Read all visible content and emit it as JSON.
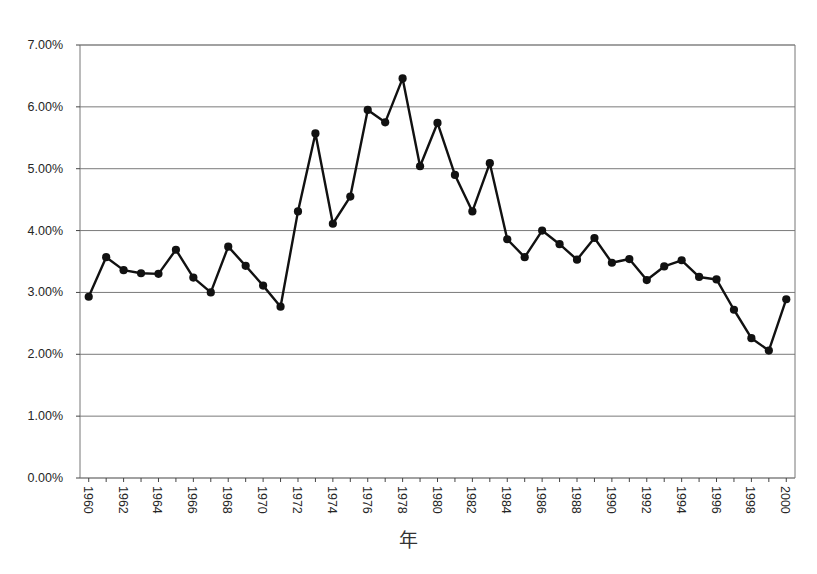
{
  "chart_data": {
    "type": "line",
    "title": "",
    "xlabel": "年",
    "ylabel": "",
    "x": [
      1960,
      1961,
      1962,
      1963,
      1964,
      1965,
      1966,
      1967,
      1968,
      1969,
      1970,
      1971,
      1972,
      1973,
      1974,
      1975,
      1976,
      1977,
      1978,
      1979,
      1980,
      1981,
      1982,
      1983,
      1984,
      1985,
      1986,
      1987,
      1988,
      1989,
      1990,
      1991,
      1992,
      1993,
      1994,
      1995,
      1996,
      1997,
      1998,
      1999,
      2000
    ],
    "values": [
      2.93,
      3.57,
      3.36,
      3.31,
      3.3,
      3.69,
      3.24,
      3.0,
      3.74,
      3.43,
      3.11,
      2.77,
      4.31,
      5.57,
      4.11,
      4.55,
      5.95,
      5.75,
      6.46,
      5.04,
      5.74,
      4.9,
      4.31,
      5.09,
      3.86,
      3.57,
      4.0,
      3.78,
      3.53,
      3.88,
      3.48,
      3.54,
      3.2,
      3.42,
      3.52,
      3.25,
      3.21,
      2.72,
      2.26,
      2.06,
      2.89
    ],
    "xlim": [
      1959.5,
      2000.5
    ],
    "ylim": [
      0.0,
      7.0
    ],
    "ytick_labels": [
      "7.00%",
      "6.00%",
      "5.00%",
      "4.00%",
      "3.00%",
      "2.00%",
      "1.00%",
      "0.00%"
    ],
    "ytick_values": [
      7.0,
      6.0,
      5.0,
      4.0,
      3.0,
      2.0,
      1.0,
      0.0
    ],
    "xtick_labels": [
      "1960",
      "1962",
      "1964",
      "1966",
      "1968",
      "1970",
      "1972",
      "1974",
      "1976",
      "1978",
      "1980",
      "1982",
      "1984",
      "1986",
      "1988",
      "1990",
      "1992",
      "1994",
      "1996",
      "1998",
      "2000"
    ],
    "xtick_values": [
      1960,
      1962,
      1964,
      1966,
      1968,
      1970,
      1972,
      1974,
      1976,
      1978,
      1980,
      1982,
      1984,
      1986,
      1988,
      1990,
      1992,
      1994,
      1996,
      1998,
      2000
    ],
    "grid": true,
    "grid_axis": "y",
    "legend": false,
    "legend_position": "none",
    "series_color": "#111111",
    "grid_color": "#7a7a7a",
    "axis_color": "#555555",
    "marker": "circle",
    "marker_size": 7,
    "line_width": 2.4,
    "value_unit": "%"
  },
  "style": {
    "background": "#ffffff",
    "plot_left": 80,
    "plot_right": 795,
    "plot_top": 45,
    "plot_bottom": 478
  }
}
